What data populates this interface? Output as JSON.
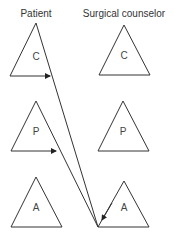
{
  "columns": {
    "patient": {
      "label": "Patient"
    },
    "counselor": {
      "label": "Surgical counselor"
    }
  },
  "ego_states": {
    "patient": [
      {
        "id": "parent",
        "label": "C"
      },
      {
        "id": "adult",
        "label": "P"
      },
      {
        "id": "child",
        "label": "A"
      }
    ],
    "counselor": [
      {
        "id": "parent",
        "label": "C"
      },
      {
        "id": "adult",
        "label": "P"
      },
      {
        "id": "child",
        "label": "A"
      }
    ]
  },
  "transactions": [
    {
      "from": "patient.C",
      "to": "counselor.A"
    },
    {
      "from": "patient.P",
      "to": "counselor.A"
    }
  ],
  "colors": {
    "line": "#333333",
    "background": "#ffffff"
  }
}
